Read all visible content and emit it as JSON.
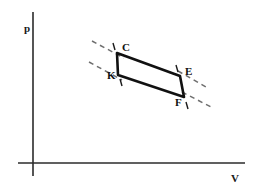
{
  "figure": {
    "name": "pressure-volume-cycle-diagram",
    "background_color": "#ffffff",
    "width": 257,
    "height": 194
  },
  "axes": {
    "vertical": {
      "label": "p",
      "label_x": 30,
      "label_y": 32,
      "x": 33,
      "y_top": 12,
      "y_bottom": 176,
      "color": "#2b2b2b"
    },
    "horizontal": {
      "label": "V",
      "label_x": 231,
      "label_y": 182,
      "y": 163,
      "x_left": 18,
      "x_right": 245,
      "color": "#2b2b2b"
    }
  },
  "chart_data": {
    "type": "line",
    "title": "",
    "xlabel": "V",
    "ylabel": "p",
    "grid": false,
    "legend": false,
    "series": [
      {
        "name": "cycle-CEFK",
        "closed": true,
        "color": "#111111",
        "points": [
          {
            "label": "C",
            "x": 117,
            "y": 53
          },
          {
            "label": "E",
            "x": 180,
            "y": 76
          },
          {
            "label": "F",
            "x": 184,
            "y": 97
          },
          {
            "label": "K",
            "x": 118,
            "y": 75
          }
        ]
      }
    ],
    "vertices": [
      {
        "label": "C",
        "x": 117,
        "y": 53,
        "label_x": 122,
        "label_y": 51,
        "tick": {
          "x1": 113,
          "y1": 43,
          "x2": 115,
          "y2": 50
        }
      },
      {
        "label": "K",
        "x": 118,
        "y": 75,
        "label_x": 107,
        "label_y": 79,
        "tick": {
          "x1": 120,
          "y1": 79,
          "x2": 122,
          "y2": 86
        }
      },
      {
        "label": "E",
        "x": 180,
        "y": 76,
        "label_x": 185,
        "label_y": 75,
        "tick": {
          "x1": 176,
          "y1": 65,
          "x2": 178,
          "y2": 72
        }
      },
      {
        "label": "F",
        "x": 184,
        "y": 97,
        "label_x": 175,
        "label_y": 106,
        "tick": {
          "x1": 186,
          "y1": 102,
          "x2": 188,
          "y2": 109
        }
      }
    ],
    "guides": [
      {
        "name": "isotherm-through-C",
        "x1": 92,
        "y1": 41,
        "x2": 124,
        "y2": 58
      },
      {
        "name": "isotherm-through-K",
        "x1": 89,
        "y1": 62,
        "x2": 122,
        "y2": 80
      },
      {
        "name": "isotherm-through-E",
        "x1": 178,
        "y1": 71,
        "x2": 206,
        "y2": 87
      },
      {
        "name": "isotherm-through-F",
        "x1": 182,
        "y1": 92,
        "x2": 211,
        "y2": 107
      }
    ]
  }
}
